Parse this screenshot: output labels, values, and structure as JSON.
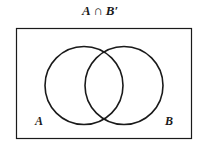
{
  "title": {
    "left": "A",
    "operator": "∩",
    "right": "B′"
  },
  "diagram": {
    "type": "venn",
    "expression": "A ∩ B′",
    "sets": [
      {
        "label": "A"
      },
      {
        "label": "B"
      }
    ],
    "shaded_region": "none",
    "colors": {
      "stroke": "#1a1a1a",
      "background": "#ffffff"
    }
  }
}
